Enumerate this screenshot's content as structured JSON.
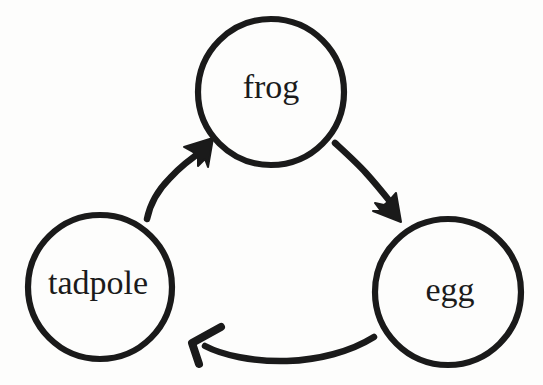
{
  "diagram": {
    "type": "cycle-diagram",
    "style": "hand-drawn",
    "background_color": "#fdfdfc",
    "ink_color": "#1a1a1a",
    "stroke_width": 6,
    "label_font_size": 34,
    "nodes": [
      {
        "id": "frog",
        "label": "frog",
        "cx": 271,
        "cy": 92,
        "r": 73,
        "label_x": 271,
        "label_y": 90
      },
      {
        "id": "tadpole",
        "label": "tadpole",
        "cx": 100,
        "cy": 287,
        "r": 72,
        "label_x": 98,
        "label_y": 286
      },
      {
        "id": "egg",
        "label": "egg",
        "cx": 448,
        "cy": 292,
        "r": 73,
        "label_x": 450,
        "label_y": 293
      }
    ],
    "edges": [
      {
        "id": "frog-to-egg",
        "from": "frog",
        "to": "egg",
        "arrowhead": "filled-wedge",
        "direction": "down-right"
      },
      {
        "id": "egg-to-tadpole",
        "from": "egg",
        "to": "tadpole",
        "arrowhead": "open-v",
        "direction": "left"
      },
      {
        "id": "tadpole-to-frog",
        "from": "tadpole",
        "to": "frog",
        "arrowhead": "filled-wedge",
        "direction": "up-right"
      }
    ]
  }
}
